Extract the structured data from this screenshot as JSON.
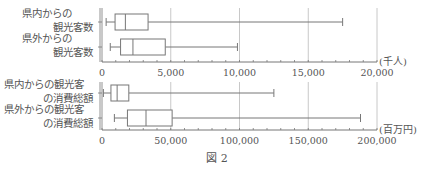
{
  "caption": "図 2",
  "chart_data": [
    {
      "type": "boxplot",
      "title": "",
      "orientation": "horizontal",
      "xlabel": "",
      "unit_label": "(千人)",
      "xlim": [
        0,
        20000
      ],
      "major_ticks": [
        0,
        5000,
        10000,
        15000,
        20000
      ],
      "tick_labels": [
        "0",
        "5,000",
        "10,000",
        "15,000",
        "20,000"
      ],
      "minor_tick_step": 1000,
      "grid": true,
      "series": [
        {
          "label_lines": [
            "県内からの",
            "観光客数"
          ],
          "name": "県内からの観光客数",
          "min": 300,
          "q1": 950,
          "median": 1700,
          "q3": 3350,
          "max": 17500
        },
        {
          "label_lines": [
            "県外からの",
            "観光客数"
          ],
          "name": "県外からの観光客数",
          "min": 600,
          "q1": 1350,
          "median": 2250,
          "q3": 4600,
          "max": 9850
        }
      ]
    },
    {
      "type": "boxplot",
      "title": "",
      "orientation": "horizontal",
      "xlabel": "",
      "unit_label": "(百万円)",
      "xlim": [
        0,
        200000
      ],
      "major_ticks": [
        0,
        50000,
        100000,
        150000,
        200000
      ],
      "tick_labels": [
        "0",
        "50,000",
        "100,000",
        "150,000",
        "200,000"
      ],
      "minor_tick_step": 10000,
      "grid": true,
      "series": [
        {
          "label_lines": [
            "県内からの観光客",
            "の消費総額"
          ],
          "name": "県内からの観光客の消費総額",
          "min": 1000,
          "q1": 6500,
          "median": 11000,
          "q3": 19500,
          "max": 125000
        },
        {
          "label_lines": [
            "県外からの観光客",
            "の消費総額"
          ],
          "name": "県外からの観光客の消費総額",
          "min": 9000,
          "q1": 18500,
          "median": 32000,
          "q3": 51000,
          "max": 188000
        }
      ]
    }
  ],
  "colors": {
    "line": "#777777",
    "grid": "#c8c8c8",
    "text": "#555555"
  }
}
